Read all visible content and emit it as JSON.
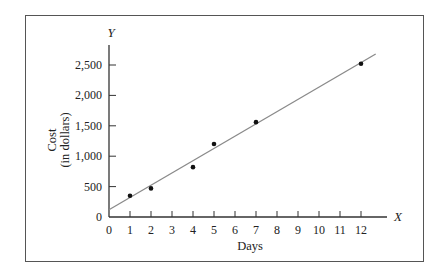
{
  "chart_data": {
    "type": "scatter",
    "title": "",
    "xlabel": "Days",
    "ylabel": "Cost (in dollars)",
    "x_axis_letter": "X",
    "y_axis_letter": "Y",
    "x_ticks": [
      "0",
      "1",
      "2",
      "3",
      "4",
      "5",
      "6",
      "7",
      "8",
      "9",
      "10",
      "11",
      "12"
    ],
    "y_ticks": [
      "0",
      "500",
      "1,000",
      "1,500",
      "2,000",
      "2,500"
    ],
    "xlim": [
      0,
      13
    ],
    "ylim": [
      0,
      2700
    ],
    "grid": false,
    "series": [
      {
        "name": "Observed cost",
        "kind": "points",
        "x": [
          1,
          2,
          4,
          5,
          7,
          12
        ],
        "y": [
          350,
          470,
          820,
          1200,
          1560,
          2520
        ]
      },
      {
        "name": "Fitted line",
        "kind": "line",
        "x": [
          0,
          12.7
        ],
        "y": [
          120,
          2680
        ]
      }
    ]
  },
  "labels": {
    "ylabel_line1": "Cost",
    "ylabel_line2": "(in dollars)",
    "xlabel": "Days",
    "x_letter": "X",
    "y_letter": "Y"
  }
}
